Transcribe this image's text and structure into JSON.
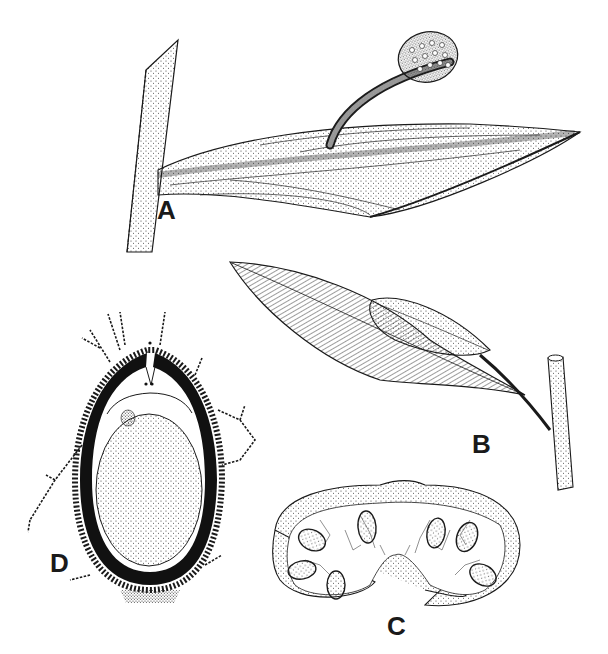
{
  "figure": {
    "type": "botanical line illustration",
    "panels": [
      {
        "id": "A",
        "label": "A",
        "subject": "leafy shoot with stalked spherical sporophyte arising from leaf surface"
      },
      {
        "id": "B",
        "label": "B",
        "subject": "lanceolate leaf with overlapping smaller leaf, attached to stem"
      },
      {
        "id": "C",
        "label": "C",
        "subject": "cross-section showing seven oval stippled bodies in branched filaments"
      },
      {
        "id": "D",
        "label": "D",
        "subject": "longitudinal section of ovoid body with dark wall and branched cellular filaments"
      }
    ]
  },
  "colors": {
    "ink": "#1a1a1a",
    "paper": "#ffffff",
    "stipple": "#333333"
  }
}
